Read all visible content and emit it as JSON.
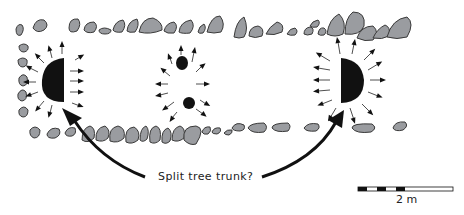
{
  "diagram": {
    "type": "archaeological-plan",
    "annotation": "Split tree trunk?",
    "scale_bar": {
      "label": "2 m",
      "segments": 6
    },
    "features": [
      {
        "name": "left-trunk-half",
        "shape": "half-disc"
      },
      {
        "name": "center-posts",
        "count": 2
      },
      {
        "name": "right-trunk-half",
        "shape": "half-disc"
      }
    ],
    "colors": {
      "stone": "#9a9ca0",
      "outline": "#3a3a3a",
      "feature": "#111111"
    }
  }
}
